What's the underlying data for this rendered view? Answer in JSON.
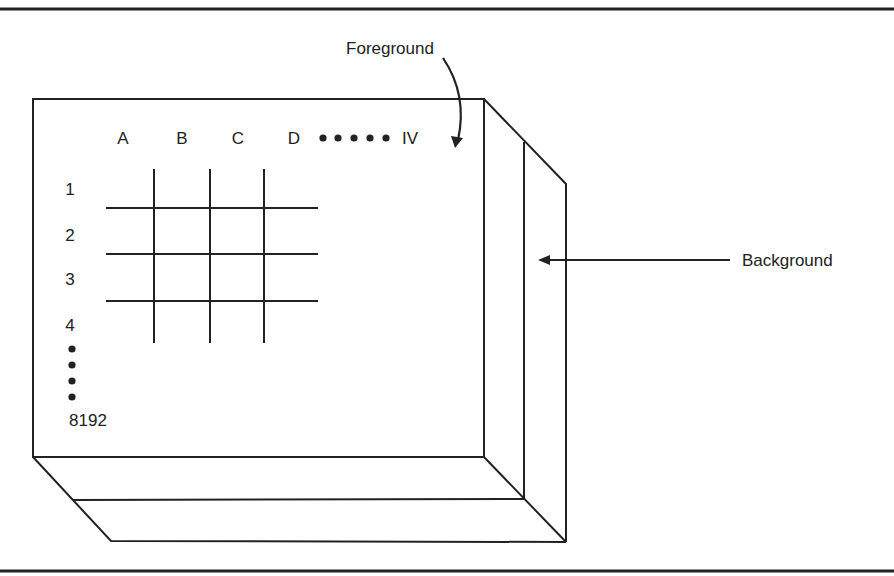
{
  "diagram": {
    "type": "3d-stack-of-grids",
    "colors": {
      "line": "#222222",
      "background": "#ffffff"
    },
    "labels": {
      "foreground": "Foreground",
      "background": "Background"
    },
    "columns": [
      "A",
      "B",
      "C",
      "D"
    ],
    "column_ellipsis": "•••••",
    "column_last": "IV",
    "rows": [
      "1",
      "2",
      "3",
      "4"
    ],
    "row_ellipsis": "••••",
    "row_last": "8192"
  }
}
